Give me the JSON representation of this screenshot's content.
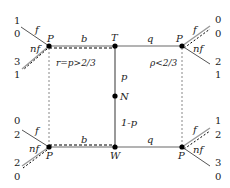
{
  "nodes": {
    "top_left": "P",
    "top_mid": "T",
    "top_right": "P",
    "mid": "N",
    "bottom_left": "P",
    "bottom_mid": "W",
    "bottom_right": "P"
  },
  "edges": {
    "top_left_b": "b",
    "top_right_q": "q",
    "bottom_left_b": "b",
    "bottom_right_q": "q",
    "vertical_upper": "p",
    "vertical_lower": "1-p"
  },
  "regions": {
    "left": "r=p>2/3",
    "right": "ρ<2/3"
  },
  "branches": {
    "f": "f",
    "nf": "nf"
  },
  "payoffs": {
    "top_left_f": [
      "1",
      "0"
    ],
    "top_left_nf": [
      "3",
      "1"
    ],
    "top_right_f": [
      "0",
      "0"
    ],
    "top_right_nf": [
      "2",
      "1"
    ],
    "bottom_left_f": [
      "0",
      "2"
    ],
    "bottom_left_nf": [
      "2",
      "0"
    ],
    "bottom_right_f": [
      "1",
      "2"
    ],
    "bottom_right_nf": [
      "3",
      "0"
    ]
  },
  "colors": {
    "line": "#8a8a8a",
    "solid": "#555555",
    "node": "#000000"
  }
}
